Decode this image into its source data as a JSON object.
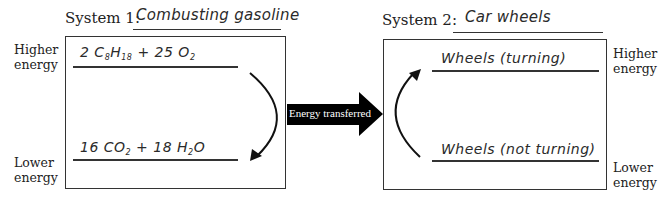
{
  "system1": {
    "label": "System 1:",
    "name": "Combusting gasoline",
    "higher_label_1": "Higher",
    "higher_label_2": "energy",
    "lower_label_1": "Lower",
    "lower_label_2": "energy",
    "reactants": {
      "coef1": "2 C",
      "sub1": "8",
      "mid1": "H",
      "sub2": "18",
      "plus": " + 25 O",
      "sub3": "2"
    },
    "products": {
      "coef1": "16 CO",
      "sub1": "2",
      "plus": " + 18 H",
      "sub2": "2",
      "end": "O"
    }
  },
  "transfer": {
    "label": "Energy transferred",
    "color": "#000000"
  },
  "system2": {
    "label": "System 2:",
    "name": "Car wheels",
    "higher_state": "Wheels (turning)",
    "lower_state": "Wheels (not turning)",
    "higher_label_1": "Higher",
    "higher_label_2": "energy",
    "lower_label_1": "Lower",
    "lower_label_2": "energy"
  }
}
